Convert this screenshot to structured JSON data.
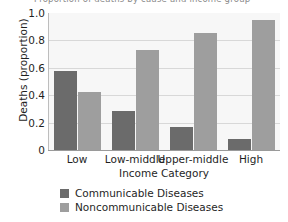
{
  "figure": {
    "clipped_top_text": "Proportion of deaths by cause and income group"
  },
  "legend": {
    "position": "below-axis",
    "entries": [
      {
        "label": "Communicable Diseases",
        "color": "#6b6b6b"
      },
      {
        "label": "Noncommunicable Diseases",
        "color": "#9e9e9e"
      }
    ]
  },
  "axes": {
    "y_label": "Deaths (proportion)",
    "x_label": "Income Category",
    "y_ticks": [
      "1.0",
      "0.8",
      "0.6",
      "0.4",
      "0.2",
      "0"
    ]
  },
  "chart_data": {
    "type": "bar",
    "title": "",
    "xlabel": "Income Category",
    "ylabel": "Deaths (proportion)",
    "ylim": [
      0,
      1.0
    ],
    "ytick_values": [
      1.0,
      0.8,
      0.6,
      0.4,
      0.2,
      0
    ],
    "grid": true,
    "legend_position": "bottom-left",
    "categories": [
      "Low",
      "Low-middle",
      "Upper-middle",
      "High"
    ],
    "series": [
      {
        "name": "Communicable Diseases",
        "color": "#6b6b6b",
        "values": [
          0.575,
          0.285,
          0.165,
          0.08
        ]
      },
      {
        "name": "Noncommunicable Diseases",
        "color": "#9e9e9e",
        "values": [
          0.425,
          0.73,
          0.855,
          0.95
        ]
      }
    ]
  }
}
